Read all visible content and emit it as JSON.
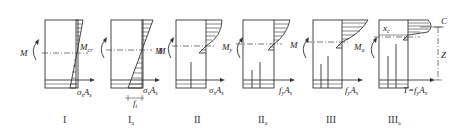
{
  "figure": {
    "panels": [
      {
        "id": "I",
        "stage_label": "I",
        "stage_sub": "",
        "moment_label": "M",
        "moment_right": "M",
        "moment_right_sub": "cr",
        "force_label": "σ",
        "force_sub": "s",
        "force_label2": "A",
        "force_sub2": "s",
        "extra": "",
        "extra_sub": ""
      },
      {
        "id": "Ia",
        "stage_label": "I",
        "stage_sub": "a",
        "moment_label": "",
        "moment_right": "M",
        "moment_right_sub": "",
        "force_label": "σ",
        "force_sub": "s",
        "force_label2": "A",
        "force_sub2": "s",
        "extra": "f",
        "extra_sub": "t"
      },
      {
        "id": "II",
        "stage_label": "II",
        "stage_sub": "",
        "moment_label": "M",
        "moment_right": "M",
        "moment_right_sub": "y",
        "force_label": "σ",
        "force_sub": "s",
        "force_label2": "A",
        "force_sub2": "s",
        "extra": "",
        "extra_sub": ""
      },
      {
        "id": "IIa",
        "stage_label": "II",
        "stage_sub": "a",
        "moment_label": "",
        "moment_right": "M",
        "moment_right_sub": "",
        "force_label": "f",
        "force_sub": "y",
        "force_label2": "A",
        "force_sub2": "s",
        "extra": "",
        "extra_sub": ""
      },
      {
        "id": "III",
        "stage_label": "III",
        "stage_sub": "",
        "moment_label": "",
        "moment_right": "M",
        "moment_right_sub": "u",
        "force_label": "f",
        "force_sub": "y",
        "force_label2": "A",
        "force_sub2": "s",
        "extra": "",
        "extra_sub": ""
      },
      {
        "id": "IIIa",
        "stage_label": "III",
        "stage_sub": "a",
        "moment_label": "",
        "moment_right": "",
        "moment_right_sub": "",
        "force_label": "T=f",
        "force_sub": "y",
        "force_label2": "A",
        "force_sub2": "s",
        "extra": "x",
        "extra_sub": "c"
      }
    ],
    "annotations": {
      "compression_label": "C",
      "lever_arm_label": "Z"
    },
    "colors": {
      "line": "#333333",
      "background": "#ffffff"
    }
  }
}
